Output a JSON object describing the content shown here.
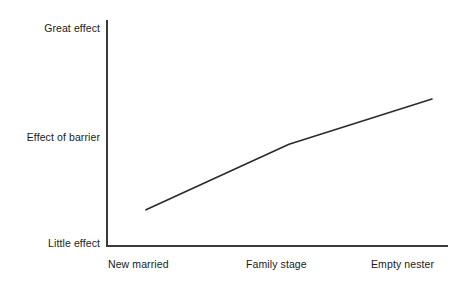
{
  "chart_data": {
    "type": "line",
    "title": "",
    "subtitle": "",
    "xlabel": "Family stage",
    "ylabel": "",
    "grid": false,
    "legend": false,
    "legend_position": "none",
    "x": [
      "New married",
      "Family stage",
      "Empty nester"
    ],
    "categories": [
      "New married",
      "Family stage",
      "Empty nester"
    ],
    "xtick_labels": [
      "New married",
      "Family stage",
      "Empty nester"
    ],
    "ytick_labels": [
      "Little effect",
      "Effect of barrier",
      "Great effect"
    ],
    "ylim": [
      "Little effect",
      "Great effect"
    ],
    "series": [
      {
        "name": "Effect of barrier",
        "values": [
          0.16,
          0.45,
          0.65
        ],
        "points": [
          {
            "x": "New married",
            "y": 0.16
          },
          {
            "x": "Family stage",
            "y": 0.45
          },
          {
            "x": "Empty nester",
            "y": 0.65
          }
        ],
        "color": "#2b2b2b",
        "style": "straight-rising"
      }
    ],
    "annotations": []
  },
  "axes": {
    "y": {
      "top_label": "Great effect",
      "middle_label": "Effect of barrier",
      "bottom_label": "Little effect",
      "color": "#3a3a3a"
    },
    "x": {
      "left_label": "New married",
      "center_label": "Family stage",
      "right_label": "Empty nester",
      "color": "#3a3a3a"
    }
  },
  "colors": {
    "background": "#ffffff",
    "axis": "#3a3a3a",
    "line": "#2b2b2b",
    "text": "#1a1a1a"
  }
}
